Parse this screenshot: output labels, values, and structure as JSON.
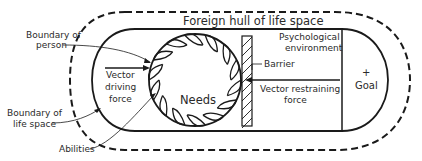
{
  "labels": {
    "foreign_hull": "Foreign hull of life space",
    "boundary_person_line1": "Boundary of",
    "boundary_person_line2": "person",
    "vector_driving_line1": "Vector",
    "vector_driving_line2": "driving",
    "vector_driving_line3": "force",
    "needs": "Needs",
    "psych_env_line1": "Psychological",
    "psych_env_line2": "environment",
    "barrier": "Barrier",
    "vector_restraining_line1": "Vector restraining",
    "vector_restraining_line2": "force",
    "goal_symbol": "+",
    "goal": "Goal",
    "boundary_life_space_line1": "Boundary of",
    "boundary_life_space_line2": "life space",
    "abilities": "Abilities"
  },
  "colors": {
    "line": "#1a1a1a",
    "text": "#2a2a2a",
    "background": "#ffffff"
  }
}
